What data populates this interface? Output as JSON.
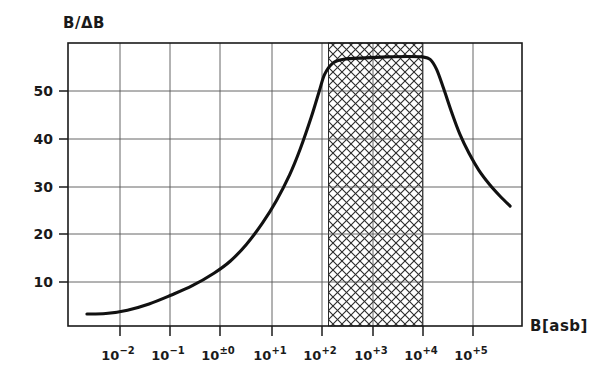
{
  "chart_data": {
    "type": "line",
    "title": "",
    "ylabel": "B/ΔB",
    "xlabel": "B[asb]",
    "xscale": "log",
    "xlim": [
      -2.7,
      5.7
    ],
    "ylim": [
      1.0,
      60.0
    ],
    "grid": true,
    "legend": null,
    "ytick_labels": [
      "10",
      "20",
      "30",
      "40",
      "50"
    ],
    "ytick_values": [
      10,
      20,
      30,
      40,
      50
    ],
    "xtick_labels": [
      {
        "base": "10",
        "exp": "−2"
      },
      {
        "base": "10",
        "exp": "−1"
      },
      {
        "base": "10",
        "exp": "±0"
      },
      {
        "base": "10",
        "exp": "+1"
      },
      {
        "base": "10",
        "exp": "+2"
      },
      {
        "base": "10",
        "exp": "+3"
      },
      {
        "base": "10",
        "exp": "+4"
      },
      {
        "base": "10",
        "exp": "+5"
      }
    ],
    "xtick_values": [
      -2,
      -1,
      0,
      1,
      2,
      3,
      4,
      5
    ],
    "series": [
      {
        "name": "contrast-sensitivity",
        "points": [
          [
            -2.35,
            3.5
          ],
          [
            -2.0,
            3.6
          ],
          [
            -1.6,
            4.3
          ],
          [
            -1.2,
            5.6
          ],
          [
            -0.8,
            7.4
          ],
          [
            -0.4,
            9.4
          ],
          [
            0.0,
            12.0
          ],
          [
            0.3,
            14.5
          ],
          [
            0.6,
            18.0
          ],
          [
            0.9,
            22.5
          ],
          [
            1.15,
            27.0
          ],
          [
            1.4,
            32.5
          ],
          [
            1.6,
            38.0
          ],
          [
            1.8,
            44.5
          ],
          [
            1.95,
            50.0
          ],
          [
            2.05,
            53.5
          ],
          [
            2.2,
            55.8
          ],
          [
            2.4,
            56.6
          ],
          [
            2.8,
            56.9
          ],
          [
            3.2,
            57.1
          ],
          [
            3.6,
            57.2
          ],
          [
            3.85,
            57.1
          ],
          [
            4.0,
            56.6
          ],
          [
            4.12,
            54.5
          ],
          [
            4.25,
            50.5
          ],
          [
            4.4,
            45.5
          ],
          [
            4.55,
            41.0
          ],
          [
            4.72,
            37.0
          ],
          [
            4.9,
            33.5
          ],
          [
            5.1,
            30.5
          ],
          [
            5.3,
            28.0
          ],
          [
            5.48,
            26.0
          ]
        ]
      }
    ],
    "shaded_bands": [
      {
        "name": "photopic-range-band",
        "x_start": 2.12,
        "x_end": 3.86,
        "style": "crosshatch",
        "color": "#2b2b2b"
      }
    ],
    "axis_color": "#1a1a1a",
    "grid_color": "#555555",
    "curve_color": "#111111"
  }
}
